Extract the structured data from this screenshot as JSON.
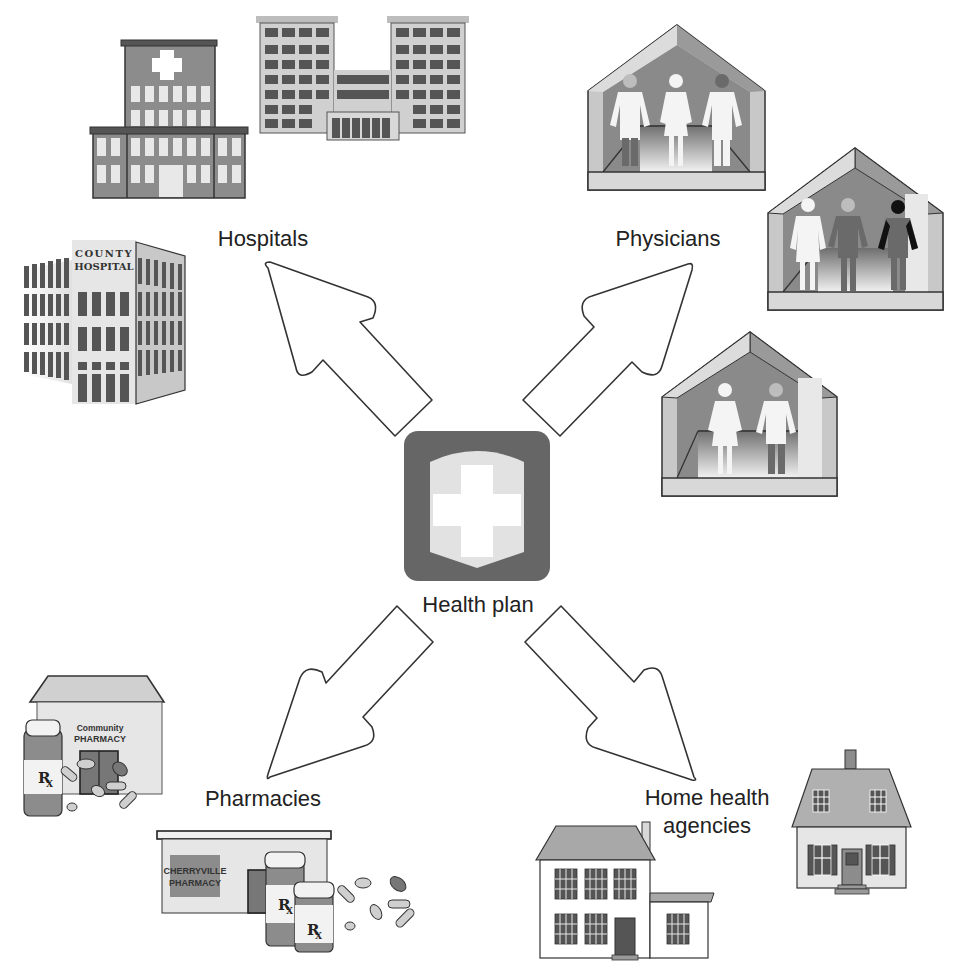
{
  "diagram": {
    "type": "hub-and-spoke",
    "hub": {
      "label": "Health plan",
      "icon": "shield-cross-icon"
    },
    "spokes": [
      {
        "id": "hospitals",
        "label": "Hospitals",
        "direction": "up-left",
        "icon": "hospital-buildings-icon"
      },
      {
        "id": "physicians",
        "label": "Physicians",
        "direction": "up-right",
        "icon": "physician-offices-icon"
      },
      {
        "id": "pharmacies",
        "label": "Pharmacies",
        "direction": "down-left",
        "icon": "pharmacy-buildings-icon"
      },
      {
        "id": "home_health",
        "label_line1": "Home health",
        "label_line2": "agencies",
        "direction": "down-right",
        "icon": "houses-icon"
      }
    ]
  },
  "signage": {
    "county_line1": "COUNTY",
    "county_line2": "HOSPITAL",
    "community_line1": "Community",
    "community_line2": "PHARMACY",
    "cherryville_line1": "CHERRYVILLE",
    "cherryville_line2": "PHARMACY",
    "rx": "R",
    "rx_sub": "X"
  },
  "colors": {
    "dark_gray": "#5a5a5a",
    "mid_gray": "#8c8c8c",
    "light_gray": "#d6d6d6",
    "outline": "#333333",
    "hub_dark": "#666666",
    "hub_shield": "#e2e2e2"
  }
}
